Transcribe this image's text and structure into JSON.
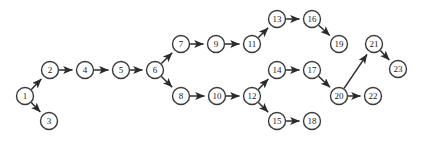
{
  "diagram": {
    "type": "directed-graph",
    "background_color": "#ffffff",
    "node_fill_color": "#ffffff",
    "node_stroke_color": "#3a3a3a",
    "edge_color": "#2b2b2b",
    "label_color": "#1a1a1a",
    "node_radius": 8.5,
    "node_stroke_width": 1.4,
    "edge_stroke_width": 1.5,
    "label_font_size": 9,
    "width": 421,
    "height": 144,
    "node_count": 23,
    "edge_count": 23,
    "nodes": [
      {
        "id": "1",
        "label": "1",
        "x": 25,
        "y": 96
      },
      {
        "id": "2",
        "label": "2",
        "x": 50,
        "y": 70
      },
      {
        "id": "3",
        "label": "3",
        "x": 49,
        "y": 121
      },
      {
        "id": "4",
        "label": "4",
        "x": 85,
        "y": 70
      },
      {
        "id": "5",
        "label": "5",
        "x": 121,
        "y": 70
      },
      {
        "id": "6",
        "label": "6",
        "x": 155,
        "y": 70
      },
      {
        "id": "7",
        "label": "7",
        "x": 181,
        "y": 44
      },
      {
        "id": "8",
        "label": "8",
        "x": 181,
        "y": 96
      },
      {
        "id": "9",
        "label": "9",
        "x": 216,
        "y": 44
      },
      {
        "id": "10",
        "label": "10",
        "x": 217,
        "y": 96
      },
      {
        "id": "11",
        "label": "11",
        "x": 252,
        "y": 44
      },
      {
        "id": "12",
        "label": "12",
        "x": 252,
        "y": 96
      },
      {
        "id": "13",
        "label": "13",
        "x": 277,
        "y": 19
      },
      {
        "id": "14",
        "label": "14",
        "x": 277,
        "y": 70
      },
      {
        "id": "15",
        "label": "15",
        "x": 277,
        "y": 121
      },
      {
        "id": "16",
        "label": "16",
        "x": 312,
        "y": 19
      },
      {
        "id": "17",
        "label": "17",
        "x": 312,
        "y": 70
      },
      {
        "id": "18",
        "label": "18",
        "x": 312,
        "y": 121
      },
      {
        "id": "19",
        "label": "19",
        "x": 339,
        "y": 44
      },
      {
        "id": "20",
        "label": "20",
        "x": 339,
        "y": 96
      },
      {
        "id": "21",
        "label": "21",
        "x": 374,
        "y": 44
      },
      {
        "id": "22",
        "label": "22",
        "x": 373,
        "y": 96
      },
      {
        "id": "23",
        "label": "23",
        "x": 398,
        "y": 69
      }
    ],
    "edges": [
      {
        "from": "1",
        "to": "2"
      },
      {
        "from": "1",
        "to": "3"
      },
      {
        "from": "2",
        "to": "4"
      },
      {
        "from": "4",
        "to": "5"
      },
      {
        "from": "5",
        "to": "6"
      },
      {
        "from": "6",
        "to": "7"
      },
      {
        "from": "6",
        "to": "8"
      },
      {
        "from": "7",
        "to": "9"
      },
      {
        "from": "9",
        "to": "11"
      },
      {
        "from": "11",
        "to": "13"
      },
      {
        "from": "13",
        "to": "16"
      },
      {
        "from": "16",
        "to": "19"
      },
      {
        "from": "8",
        "to": "10"
      },
      {
        "from": "10",
        "to": "12"
      },
      {
        "from": "12",
        "to": "14"
      },
      {
        "from": "12",
        "to": "15"
      },
      {
        "from": "14",
        "to": "17"
      },
      {
        "from": "15",
        "to": "18"
      },
      {
        "from": "17",
        "to": "20"
      },
      {
        "from": "20",
        "to": "21"
      },
      {
        "from": "20",
        "to": "22"
      },
      {
        "from": "21",
        "to": "23"
      }
    ]
  }
}
